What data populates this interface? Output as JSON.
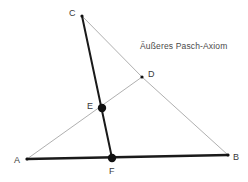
{
  "figure": {
    "title_caption": "Äußeres Pasch-Axiom",
    "caption_position": {
      "x": 140,
      "y": 42
    },
    "width": 248,
    "height": 182,
    "background_color": "#ffffff"
  },
  "colors": {
    "solid_line": "#1a1a1a",
    "light_line": "#b0b0b0",
    "point_fill": "#111111",
    "label_text": "#3a3a3a",
    "caption_text": "#4a4a4a"
  },
  "points": [
    {
      "id": "A",
      "label": "A",
      "x": 27,
      "y": 159,
      "marker": "small",
      "label_x": 14,
      "label_y": 156
    },
    {
      "id": "B",
      "label": "B",
      "x": 228,
      "y": 155,
      "marker": "small",
      "label_x": 233,
      "label_y": 153
    },
    {
      "id": "C",
      "label": "C",
      "x": 82,
      "y": 16,
      "marker": "small",
      "label_x": 69,
      "label_y": 9
    },
    {
      "id": "D",
      "label": "D",
      "x": 142,
      "y": 77,
      "marker": "small",
      "label_x": 148,
      "label_y": 70
    },
    {
      "id": "E",
      "label": "E",
      "x": 102,
      "y": 108,
      "marker": "large",
      "label_x": 87,
      "label_y": 102
    },
    {
      "id": "F",
      "label": "F",
      "x": 112,
      "y": 158,
      "marker": "large",
      "label_x": 109,
      "label_y": 167
    }
  ],
  "segments": [
    {
      "id": "AB",
      "from": "A",
      "to": "B",
      "style": "solid",
      "width": 2.4,
      "x1": 27,
      "y1": 159,
      "x2": 228,
      "y2": 155
    },
    {
      "id": "CF",
      "from": "C",
      "to": "F",
      "style": "solid",
      "width": 2.0,
      "x1": 82,
      "y1": 16,
      "x2": 112,
      "y2": 158
    },
    {
      "id": "AD",
      "from": "A",
      "to": "D",
      "style": "light",
      "width": 1.0,
      "x1": 27,
      "y1": 159,
      "x2": 142,
      "y2": 77
    },
    {
      "id": "CD",
      "from": "C",
      "to": "D",
      "style": "light",
      "width": 1.0,
      "x1": 82,
      "y1": 16,
      "x2": 142,
      "y2": 77
    },
    {
      "id": "DB",
      "from": "D",
      "to": "B",
      "style": "light",
      "width": 1.0,
      "x1": 142,
      "y1": 77,
      "x2": 228,
      "y2": 155
    }
  ],
  "marker_radii": {
    "small": 1.6,
    "large": 4.2
  }
}
